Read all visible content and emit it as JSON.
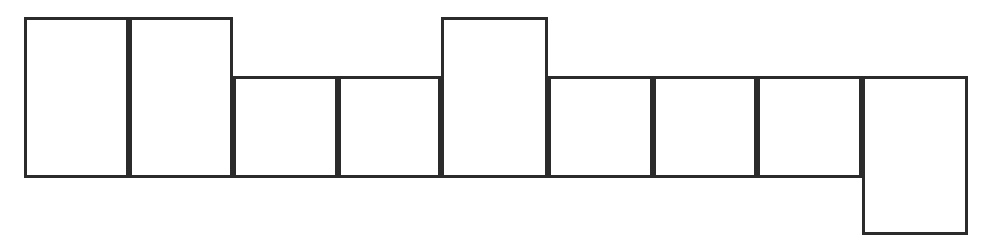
{
  "figure": {
    "canvas": {
      "width": 994,
      "height": 243,
      "background": "#ffffff"
    },
    "style": {
      "stroke_color": "#2b2b2b",
      "stroke_width": 3,
      "fill_color": "#ffffff"
    },
    "baseline_y": 178,
    "tall_top_y": 17,
    "short_top_y": 76,
    "drop_bottom_y": 235
  },
  "chart_data": {
    "type": "bar",
    "xlabel": "",
    "ylabel": "",
    "grid": false,
    "legend": null,
    "axis_visible": false,
    "categories": [
      "1",
      "2",
      "3",
      "4",
      "5",
      "6",
      "7",
      "8"
    ],
    "values": [
      161,
      161,
      102,
      102,
      161,
      102,
      102,
      102
    ],
    "ylim": [
      0,
      218
    ],
    "note": "Values are rectangle heights in pixels measured from the shared baseline; bar 8 is offset downward."
  },
  "blocks": [
    {
      "id": "block-1",
      "label": "1",
      "x": 24,
      "y": 17,
      "width": 105,
      "height": 161,
      "top_level": "tall",
      "baseline_aligned": true
    },
    {
      "id": "block-2",
      "label": "2",
      "x": 129,
      "y": 17,
      "width": 104,
      "height": 161,
      "top_level": "tall",
      "baseline_aligned": true
    },
    {
      "id": "block-3",
      "label": "3",
      "x": 233,
      "y": 76,
      "width": 105,
      "height": 102,
      "top_level": "short",
      "baseline_aligned": true
    },
    {
      "id": "block-4",
      "label": "4",
      "x": 338,
      "y": 76,
      "width": 103,
      "height": 102,
      "top_level": "short",
      "baseline_aligned": true
    },
    {
      "id": "block-5",
      "label": "5",
      "x": 441,
      "y": 17,
      "width": 107,
      "height": 161,
      "top_level": "tall",
      "baseline_aligned": true
    },
    {
      "id": "block-6",
      "label": "6",
      "x": 548,
      "y": 76,
      "width": 105,
      "height": 102,
      "top_level": "short",
      "baseline_aligned": true
    },
    {
      "id": "block-7",
      "label": "7",
      "x": 653,
      "y": 76,
      "width": 104,
      "height": 102,
      "top_level": "short",
      "baseline_aligned": true
    },
    {
      "id": "block-8",
      "label": "8",
      "x": 757,
      "y": 76,
      "width": 105,
      "height": 102,
      "top_level": "short",
      "baseline_aligned": true
    },
    {
      "id": "block-9",
      "label": "9",
      "x": 862,
      "y": 76,
      "width": 106,
      "height": 159,
      "top_level": "short",
      "baseline_aligned": false
    }
  ]
}
